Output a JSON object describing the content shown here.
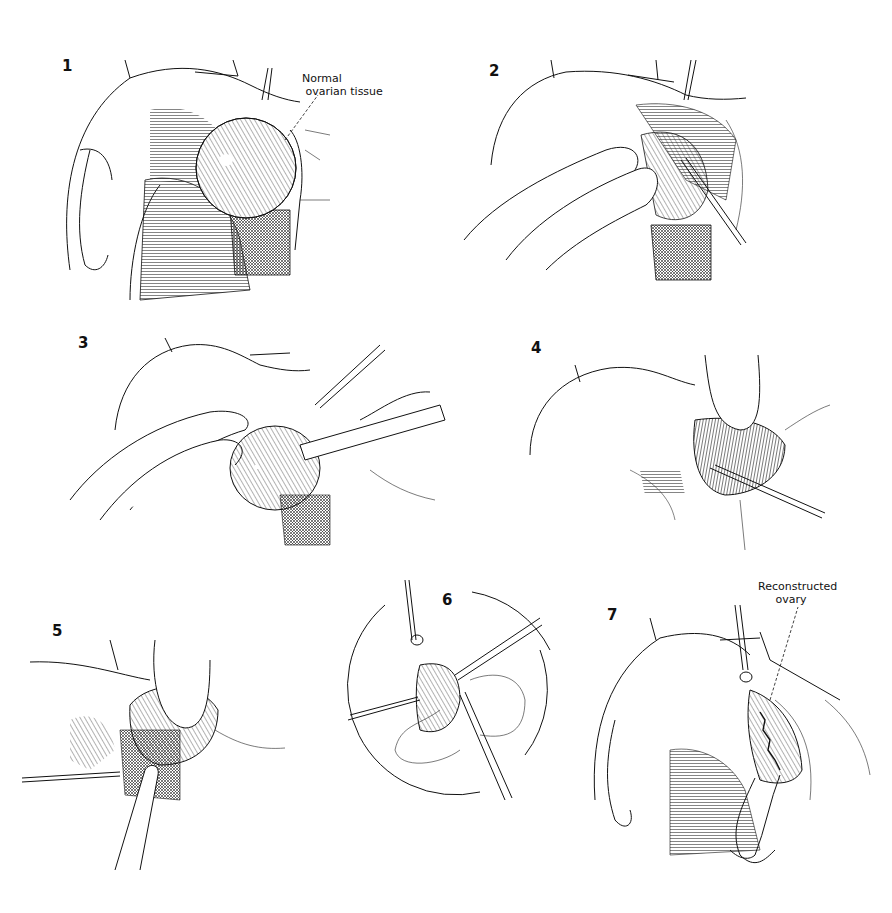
{
  "figure": {
    "type": "surgical-illustration",
    "panel_count": 7,
    "panels": [
      {
        "number": "1",
        "label": "Normal\n ovarian tissue",
        "subject": "ovarian cyst exposed"
      },
      {
        "number": "2",
        "label": "",
        "subject": "fingers retracting ovary, incision"
      },
      {
        "number": "3",
        "label": "",
        "subject": "cyst shelled out with instrument"
      },
      {
        "number": "4",
        "label": "",
        "subject": "finger in cyst bed, scalpel"
      },
      {
        "number": "5",
        "label": "",
        "subject": "finger pressing ovary, forceps"
      },
      {
        "number": "6",
        "label": "",
        "subject": "circular inset: suturing ovary"
      },
      {
        "number": "7",
        "label": "Reconstructed\n     ovary",
        "subject": "reconstructed ovary with sutures"
      }
    ]
  },
  "colors": {
    "ink": "#111111",
    "background": "#ffffff"
  }
}
